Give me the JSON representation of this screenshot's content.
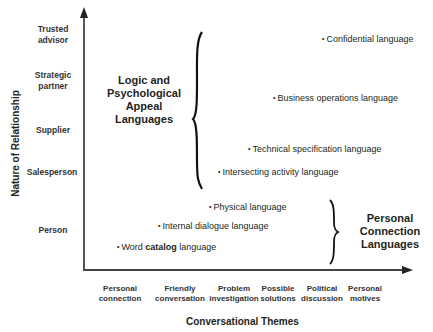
{
  "diagram": {
    "y_axis_title": "Nature of Relationship",
    "x_axis_title": "Conversational Themes",
    "y_levels": [
      {
        "line1": "Trusted",
        "line2": "advisor"
      },
      {
        "line1": "Strategic",
        "line2": "partner"
      },
      {
        "line1": "Supplier",
        "line2": ""
      },
      {
        "line1": "Salesperson",
        "line2": ""
      },
      {
        "line1": "Person",
        "line2": ""
      }
    ],
    "x_levels": [
      {
        "line1": "Personal",
        "line2": "connection"
      },
      {
        "line1": "Friendly",
        "line2": "conversation"
      },
      {
        "line1": "Problem",
        "line2": "investigation"
      },
      {
        "line1": "Possible",
        "line2": "solutions"
      },
      {
        "line1": "Political",
        "line2": "discussion"
      },
      {
        "line1": "Personal",
        "line2": "motives"
      }
    ],
    "items": [
      {
        "label": "Confidential language"
      },
      {
        "label": "Business operations language"
      },
      {
        "label": "Technical specification language"
      },
      {
        "label": "Intersecting activity language"
      },
      {
        "label": "Physical language"
      },
      {
        "label": "Internal dialogue language"
      },
      {
        "prefix": "Word ",
        "bold": "catalog",
        "suffix": " language"
      }
    ],
    "bullet": "•",
    "groups": {
      "logic": {
        "line1": "Logic and",
        "line2": "Psychological",
        "line3": "Appeal",
        "line4": "Languages"
      },
      "personal": {
        "line1": "Personal",
        "line2": "Connection",
        "line3": "Languages"
      }
    }
  }
}
